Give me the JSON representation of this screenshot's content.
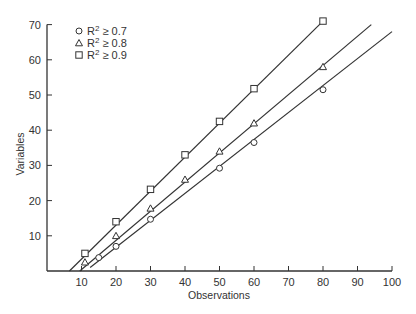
{
  "chart_data": {
    "type": "line",
    "title": "",
    "xlabel": "Observations",
    "ylabel": "Variables",
    "xlim": [
      0,
      100
    ],
    "ylim": [
      0,
      70
    ],
    "x_ticks": [
      10,
      20,
      30,
      40,
      50,
      60,
      70,
      80,
      90,
      100
    ],
    "y_ticks": [
      10,
      20,
      30,
      40,
      50,
      60,
      70
    ],
    "grid": false,
    "legend_position": "upper-left",
    "series": [
      {
        "name": "R² ≥ 0.7",
        "label_prefix": "R",
        "label_sup": "2",
        "label_suffix": " ≥ 0.7",
        "marker": "circle",
        "points": [
          [
            15,
            3.8
          ],
          [
            20,
            7
          ],
          [
            30,
            14.7
          ],
          [
            50,
            29.2
          ],
          [
            60,
            36.5
          ],
          [
            80,
            51.5
          ]
        ],
        "fit_line": [
          [
            12.5,
            1
          ],
          [
            100,
            68
          ]
        ]
      },
      {
        "name": "R² ≥ 0.8",
        "label_prefix": "R",
        "label_sup": "2",
        "label_suffix": " ≥ 0.8",
        "marker": "triangle",
        "points": [
          [
            11,
            2.5
          ],
          [
            20,
            10
          ],
          [
            30,
            17.8
          ],
          [
            40,
            26
          ],
          [
            50,
            34
          ],
          [
            60,
            42
          ],
          [
            80,
            58
          ]
        ],
        "fit_line": [
          [
            9.5,
            0
          ],
          [
            94,
            70
          ]
        ]
      },
      {
        "name": "R² ≥ 0.9",
        "label_prefix": "R",
        "label_sup": "2",
        "label_suffix": " ≥ 0.9",
        "marker": "square",
        "points": [
          [
            11,
            5
          ],
          [
            20,
            14
          ],
          [
            30,
            23.2
          ],
          [
            40,
            33
          ],
          [
            50,
            42.5
          ],
          [
            60,
            51.8
          ],
          [
            80,
            71
          ]
        ],
        "fit_line": [
          [
            6.5,
            0
          ],
          [
            80,
            71
          ]
        ]
      }
    ]
  }
}
